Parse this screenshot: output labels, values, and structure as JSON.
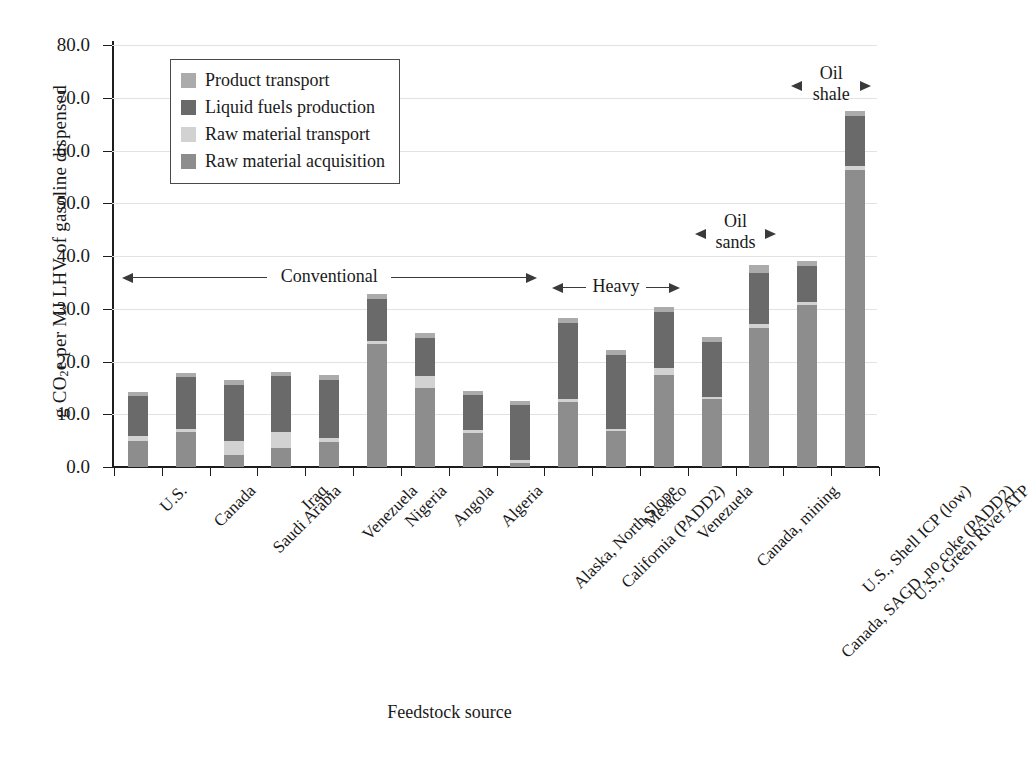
{
  "chart_data": {
    "type": "bar",
    "stacked": true,
    "title": "",
    "xlabel": "Feedstock source",
    "ylabel": "g CO2e per MJ LHV of gasoline dispensed",
    "ylim": [
      0,
      80
    ],
    "ytick_step": 10,
    "ytick_labels": [
      "0.0",
      "10.0",
      "20.0",
      "30.0",
      "40.0",
      "50.0",
      "60.0",
      "70.0",
      "80.0"
    ],
    "grid": true,
    "legend_position": "upper-left-inset",
    "categories": [
      "U.S.",
      "Canada",
      "Saudi Arabia",
      "Iraq",
      "Venezuela",
      "Nigeria",
      "Angola",
      "Algeria",
      "Alaska, North Slope",
      "California (PADD2)",
      "Mexico",
      "Venezuela",
      "Canada, mining",
      "Canada, SAGD, no coke (PADD2)",
      "U.S., Shell ICP (low)",
      "U.S., Green River ATP"
    ],
    "series": [
      {
        "name": "Raw material acquisition",
        "color": "#8d8d8d",
        "values": [
          5.0,
          6.7,
          2.2,
          3.6,
          4.7,
          23.3,
          14.9,
          6.4,
          0.8,
          12.4,
          6.8,
          17.5,
          12.8,
          26.3,
          30.7,
          56.4
        ]
      },
      {
        "name": "Raw material transport",
        "color": "#d2d2d2",
        "values": [
          0.8,
          0.5,
          2.8,
          3.0,
          0.8,
          0.6,
          2.3,
          0.6,
          0.5,
          0.5,
          0.5,
          1.3,
          0.5,
          0.9,
          0.6,
          0.6
        ]
      },
      {
        "name": "Liquid fuels production",
        "color": "#6a6a6a",
        "values": [
          7.6,
          9.9,
          10.6,
          10.6,
          11.0,
          8.0,
          7.3,
          6.6,
          10.4,
          14.4,
          13.9,
          10.6,
          10.4,
          9.6,
          6.8,
          9.5
        ]
      },
      {
        "name": "Product transport",
        "color": "#ababab",
        "values": [
          0.9,
          0.8,
          0.9,
          0.9,
          0.9,
          0.9,
          0.9,
          0.9,
          0.9,
          0.9,
          0.9,
          1.0,
          0.9,
          1.5,
          0.9,
          1.0
        ]
      }
    ],
    "totals": [
      14.3,
      17.9,
      16.5,
      18.1,
      17.4,
      32.8,
      25.4,
      14.5,
      12.6,
      28.2,
      22.1,
      30.4,
      24.6,
      38.3,
      39.0,
      67.5
    ],
    "annotations": [
      {
        "label": "Conventional",
        "lines": [
          "Conventional"
        ],
        "from_category": 0,
        "to_category": 8,
        "style": "double-arrow"
      },
      {
        "label": "Heavy",
        "lines": [
          "Heavy"
        ],
        "from_category": 9,
        "to_category": 11,
        "style": "double-arrow"
      },
      {
        "label": "Oil sands",
        "lines": [
          "Oil",
          "sands"
        ],
        "from_category": 12,
        "to_category": 13,
        "style": "double-arrow"
      },
      {
        "label": "Oil shale",
        "lines": [
          "Oil",
          "shale"
        ],
        "from_category": 14,
        "to_category": 15,
        "style": "double-arrow"
      }
    ]
  },
  "legend": {
    "items": [
      {
        "label": "Product transport",
        "color": "#ababab"
      },
      {
        "label": "Liquid fuels production",
        "color": "#6a6a6a"
      },
      {
        "label": "Raw material transport",
        "color": "#d2d2d2"
      },
      {
        "label": "Raw material acquisition",
        "color": "#8d8d8d"
      }
    ]
  },
  "axis": {
    "ylabel_prefix": "g CO",
    "ylabel_sub": "2",
    "ylabel_suffix": "e per MJ LHV of gasoline dispensed",
    "xlabel": "Feedstock source"
  }
}
